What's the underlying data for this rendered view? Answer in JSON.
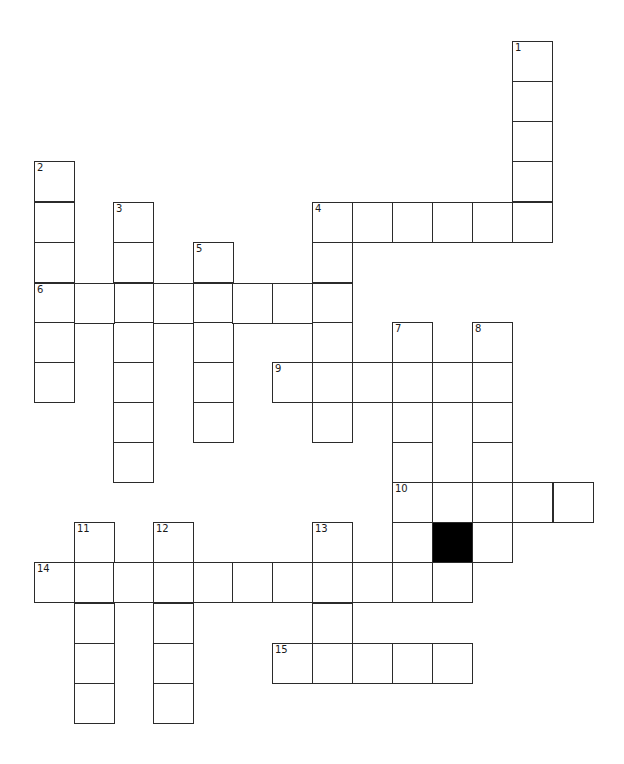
{
  "puzzle": {
    "type": "crossword",
    "cell_size_px": 40,
    "origin": {
      "x": 34,
      "y": 41
    },
    "colors": {
      "border": "#2b2b2b",
      "cell": "#ffffff",
      "block": "#000000",
      "background": "#ffffff"
    },
    "entries": [
      {
        "number": "1",
        "direction": "down",
        "row": 0,
        "col": 12,
        "length": 5
      },
      {
        "number": "2",
        "direction": "down",
        "row": 3,
        "col": 0,
        "length": 6
      },
      {
        "number": "3",
        "direction": "down",
        "row": 4,
        "col": 2,
        "length": 7
      },
      {
        "number": "4",
        "direction": "across",
        "row": 4,
        "col": 7,
        "length": 6
      },
      {
        "number": "4",
        "direction": "down",
        "row": 4,
        "col": 7,
        "length": 6
      },
      {
        "number": "5",
        "direction": "down",
        "row": 5,
        "col": 4,
        "length": 5
      },
      {
        "number": "6",
        "direction": "across",
        "row": 6,
        "col": 0,
        "length": 8
      },
      {
        "number": "7",
        "direction": "down",
        "row": 7,
        "col": 9,
        "length": 7
      },
      {
        "number": "8",
        "direction": "down",
        "row": 7,
        "col": 11,
        "length": 6
      },
      {
        "number": "9",
        "direction": "across",
        "row": 8,
        "col": 6,
        "length": 6
      },
      {
        "number": "10",
        "direction": "across",
        "row": 11,
        "col": 9,
        "length": 5
      },
      {
        "number": "11",
        "direction": "down",
        "row": 12,
        "col": 1,
        "length": 5
      },
      {
        "number": "12",
        "direction": "down",
        "row": 12,
        "col": 3,
        "length": 5
      },
      {
        "number": "13",
        "direction": "down",
        "row": 12,
        "col": 7,
        "length": 3
      },
      {
        "number": "14",
        "direction": "across",
        "row": 13,
        "col": 0,
        "length": 11
      },
      {
        "number": "15",
        "direction": "across",
        "row": 15,
        "col": 6,
        "length": 5
      }
    ],
    "blocks": [
      {
        "row": 12,
        "col": 10
      }
    ]
  }
}
